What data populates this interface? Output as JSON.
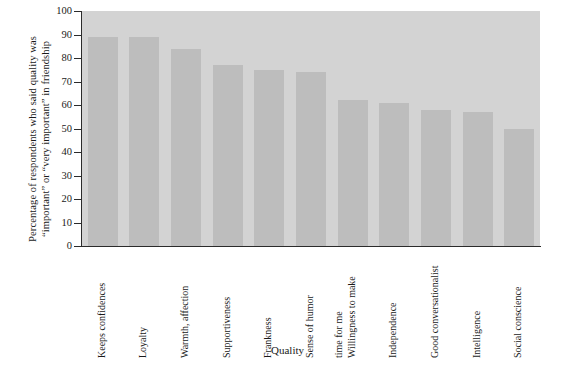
{
  "chart_data": {
    "type": "bar",
    "title": "",
    "xlabel": "Quality",
    "ylabel_lines": [
      "Percentage of respondents who said quality was",
      "“important” or “very important” in friendship"
    ],
    "ylabel": "Percentage of respondents who said quality was “important” or “very important” in friendship",
    "categories": [
      "Keeps confidences",
      "Loyalty",
      "Warmth, affection",
      "Supportiveness",
      "Frankness",
      "Sense of humor",
      "Willingness to make time for me",
      "Independence",
      "Good conversationalist",
      "Intelligence",
      "Social conscience"
    ],
    "category_lines": [
      [
        "Keeps confidences"
      ],
      [
        "Loyalty"
      ],
      [
        "Warmth, affection"
      ],
      [
        "Supportiveness"
      ],
      [
        "Frankness"
      ],
      [
        "Sense of humor"
      ],
      [
        "Willingness to make",
        "time for me"
      ],
      [
        "Independence"
      ],
      [
        "Good conversationalist"
      ],
      [
        "Intelligence"
      ],
      [
        "Social conscience"
      ]
    ],
    "values": [
      89,
      89,
      84,
      77,
      75,
      74,
      62,
      61,
      58,
      57,
      50
    ],
    "ylim": [
      0,
      100
    ],
    "yticks": [
      0,
      10,
      20,
      30,
      40,
      50,
      60,
      70,
      80,
      90,
      100
    ],
    "grid": false,
    "legend": "none",
    "plot_background_color": "#d3d3d3",
    "bar_color": "#bdbdbd",
    "axis_color": "#2b2b2b"
  }
}
